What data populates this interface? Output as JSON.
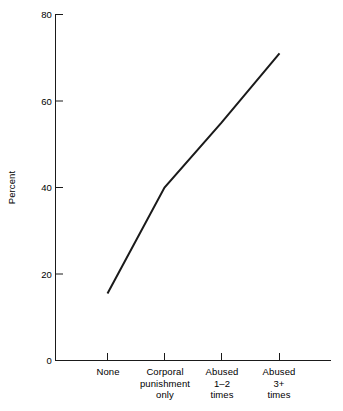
{
  "chart_data": {
    "type": "line",
    "title": "",
    "subtitle": "",
    "xlabel": "",
    "ylabel": "Percent",
    "categories": [
      "None",
      "Corporal punishment only",
      "Abused 1–2 times",
      "Abused 3+ times"
    ],
    "category_lines": [
      [
        "None"
      ],
      [
        "Corporal",
        "punishment",
        "only"
      ],
      [
        "Abused",
        "1–2",
        "times"
      ],
      [
        "Abused",
        "3+",
        "times"
      ]
    ],
    "values": [
      15.5,
      40,
      55,
      71
    ],
    "series": [
      {
        "name": "Percent",
        "values": [
          15.5,
          40,
          55,
          71
        ]
      }
    ],
    "ylim": [
      0,
      80
    ],
    "yticks": [
      0,
      20,
      40,
      60,
      80
    ],
    "ytick_labels": [
      "0",
      "20",
      "40",
      "60",
      "80"
    ],
    "grid": false,
    "legend": false,
    "legend_position": "none",
    "line_color": "#1a1a1a",
    "axis_color": "#1a1a1a",
    "background": "#ffffff",
    "annotations": []
  },
  "axes": {
    "y_title": "Percent",
    "y_tick_labels": [
      "80",
      "60",
      "40",
      "20",
      "0"
    ],
    "x_tick_labels": [
      "None",
      "Corporal punishment only",
      "Abused 1–2 times",
      "Abused 3+ times"
    ]
  },
  "x_labels": {
    "cat0_line0": "None",
    "cat1_line0": "Corporal",
    "cat1_line1": "punishment",
    "cat1_line2": "only",
    "cat2_line0": "Abused",
    "cat2_line1": "1–2",
    "cat2_line2": "times",
    "cat3_line0": "Abused",
    "cat3_line1": "3+",
    "cat3_line2": "times"
  },
  "y_labels": {
    "t80": "80",
    "t60": "60",
    "t40": "40",
    "t20": "20",
    "t0": "0"
  }
}
